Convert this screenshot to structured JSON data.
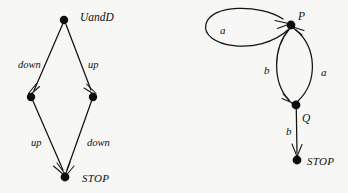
{
  "figure": {
    "background_color": "#f7f7f5",
    "ink_color": "#121212",
    "diagrams": [
      {
        "id": "left",
        "name": "uandd-transition-diagram",
        "nodes": [
          {
            "id": "top",
            "label": "UandD",
            "cx": 64,
            "cy": 20,
            "r": 4.2,
            "label_x": 80,
            "label_y": 17
          },
          {
            "id": "left",
            "label": "",
            "cx": 31,
            "cy": 97,
            "r": 4.2
          },
          {
            "id": "right",
            "label": "",
            "cx": 93,
            "cy": 97,
            "r": 4.2
          },
          {
            "id": "stop",
            "label": "STOP",
            "cx": 65,
            "cy": 177,
            "r": 4.4,
            "label_x": 82,
            "label_y": 179
          }
        ],
        "edges": [
          {
            "from": "top",
            "to": "left",
            "label": "down",
            "label_x": 18,
            "label_y": 64
          },
          {
            "from": "top",
            "to": "right",
            "label": "up",
            "label_x": 89,
            "label_y": 64
          },
          {
            "from": "left",
            "to": "stop",
            "label": "up",
            "label_x": 32,
            "label_y": 144
          },
          {
            "from": "right",
            "to": "stop",
            "label": "down",
            "label_x": 88,
            "label_y": 144
          }
        ]
      },
      {
        "id": "right",
        "name": "pq-transition-diagram",
        "nodes": [
          {
            "id": "P",
            "label": "P",
            "cx": 291,
            "cy": 25,
            "r": 4.4,
            "label_x": 298,
            "label_y": 16
          },
          {
            "id": "Q",
            "label": "Q",
            "cx": 296,
            "cy": 105,
            "r": 4.4,
            "label_x": 302,
            "label_y": 118
          },
          {
            "id": "STOP",
            "label": "STOP",
            "cx": 297,
            "cy": 160,
            "r": 4.4,
            "label_x": 307,
            "label_y": 163
          }
        ],
        "edges": [
          {
            "from": "P",
            "to": "P",
            "label": "a",
            "label_x": 221,
            "label_y": 30,
            "kind": "self-loop"
          },
          {
            "from": "P",
            "to": "Q",
            "label": "b",
            "label_x": 265,
            "label_y": 70,
            "kind": "curve-left"
          },
          {
            "from": "Q",
            "to": "P",
            "label": "a",
            "label_x": 322,
            "label_y": 72,
            "kind": "curve-right"
          },
          {
            "from": "Q",
            "to": "STOP",
            "label": "b",
            "label_x": 287,
            "label_y": 131,
            "kind": "straight"
          }
        ]
      }
    ]
  },
  "labels": {
    "uandd": "UandD",
    "stop_left": "STOP",
    "down_upper": "down",
    "up_upper": "up",
    "up_lower": "up",
    "down_lower": "down",
    "p": "P",
    "q": "Q",
    "stop_right": "STOP",
    "a_self": "a",
    "b_p_to_q": "b",
    "a_q_to_p": "a",
    "b_q_to_stop": "b"
  }
}
